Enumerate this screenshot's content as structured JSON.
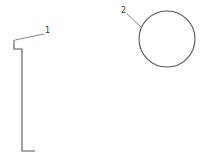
{
  "diagram": {
    "background": "#ffffff",
    "stroke_color": "#555555",
    "labels": [
      {
        "id": "1",
        "text": "1",
        "x": 45,
        "y": 33
      },
      {
        "id": "2",
        "text": "2",
        "x": 121,
        "y": 13
      }
    ],
    "parts": [
      {
        "id": "1",
        "name": "bracket-profile",
        "shape": "polyline"
      },
      {
        "id": "2",
        "name": "circle-profile",
        "shape": "circle",
        "cx": 167,
        "cy": 39,
        "r": 28
      }
    ]
  }
}
